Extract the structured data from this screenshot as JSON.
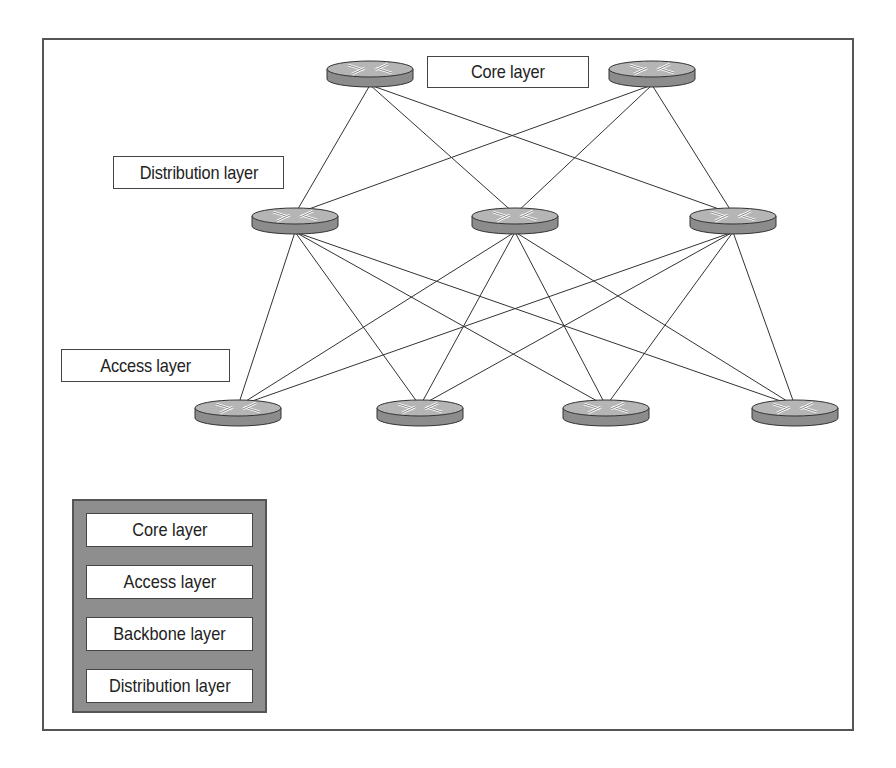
{
  "diagram": {
    "labels": {
      "core": "Core layer",
      "distribution": "Distribution layer",
      "access": "Access layer"
    },
    "routers": {
      "core": [
        {
          "x": 370,
          "y": 73
        },
        {
          "x": 652,
          "y": 73
        }
      ],
      "distribution": [
        {
          "x": 295,
          "y": 220
        },
        {
          "x": 515,
          "y": 220
        },
        {
          "x": 733,
          "y": 220
        }
      ],
      "access": [
        {
          "x": 238,
          "y": 412
        },
        {
          "x": 420,
          "y": 412
        },
        {
          "x": 606,
          "y": 412
        },
        {
          "x": 795,
          "y": 412
        }
      ]
    },
    "router_icon": "router-icon",
    "colors": {
      "router_top": "#b5b5b5",
      "router_side": "#8c8c8c",
      "line": "#333333",
      "legend_bg": "#8e8e8e"
    }
  },
  "answer_options": [
    {
      "label": "Core layer"
    },
    {
      "label": "Access layer"
    },
    {
      "label": "Backbone layer"
    },
    {
      "label": "Distribution layer"
    }
  ]
}
